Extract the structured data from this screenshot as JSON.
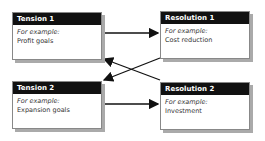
{
  "boxes": {
    "tension1": {
      "title": "Tension 1",
      "example_label": "For example:",
      "example": "Profit goals"
    },
    "resolution1": {
      "title": "Resolution 1",
      "example_label": "For example:",
      "example": "Cost reduction"
    },
    "tension2": {
      "title": "Tension 2",
      "example_label": "For example:",
      "example": "Expansion goals"
    },
    "resolution2": {
      "title": "Resolution 2",
      "example_label": "For example:",
      "example": "Investment"
    }
  },
  "arrows": [
    {
      "from": "Tension 1",
      "to": "Resolution 1"
    },
    {
      "from": "Tension 2",
      "to": "Resolution 2"
    },
    {
      "from": "Resolution 2",
      "to": "Tension 1"
    },
    {
      "from": "Resolution 1",
      "to": "Tension 2"
    }
  ]
}
